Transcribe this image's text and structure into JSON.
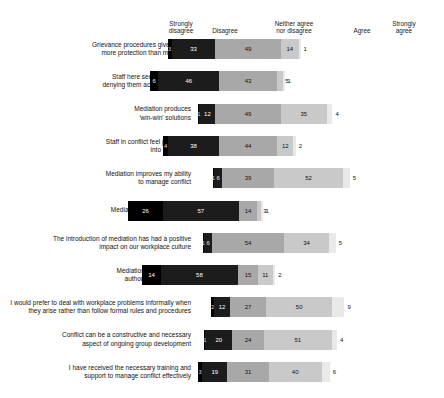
{
  "chart_data": {
    "type": "bar",
    "subtype": "diverging-stacked-likert",
    "title": "",
    "xlabel": "",
    "ylabel": "",
    "legend_position": "top",
    "grid": false,
    "value_unit": "percent",
    "categories_legend": [
      "Strongly\ndisagree",
      "Disagree",
      "Neither agree\nnor disagree",
      "Agree",
      "Strongly\nagree"
    ],
    "series_names": [
      "Strongly disagree",
      "Disagree",
      "Neither agree nor disagree",
      "Agree",
      "Strongly agree"
    ],
    "colors": [
      "#000000",
      "#1c1c1c",
      "#a8a8a8",
      "#c9c9c9",
      "#e9e9e9"
    ],
    "categories": [
      "Grievance procedures give parties more protection than mediation",
      "Staff here see mediation as denying them access to justice",
      "Mediation produces 'win-win' solutions",
      "Staff in conflict feel pressured into mediation",
      "Mediation improves my ability to manage conflict",
      "Mediation is a waste of time",
      "The introduction of mediation has had a positive impact on our workplace culture",
      "Mediation undermines my authority as a manager",
      "I would prefer to deal with workplace problems informally when they arise rather than follow formal rules and procedures",
      "Conflict can be a constructive and necessary aspect of ongoing group development",
      "I have received the necessary training and support to manage conflict effectively"
    ],
    "series": [
      {
        "name": "Strongly disagree",
        "values": [
          3,
          6,
          1,
          4,
          1,
          26,
          1,
          14,
          2,
          1,
          3
        ]
      },
      {
        "name": "Disagree",
        "values": [
          33,
          46,
          12,
          38,
          6,
          57,
          6,
          58,
          12,
          20,
          19
        ]
      },
      {
        "name": "Neither agree nor disagree",
        "values": [
          49,
          43,
          49,
          44,
          39,
          14,
          54,
          15,
          27,
          24,
          31
        ]
      },
      {
        "name": "Agree",
        "values": [
          14,
          5,
          35,
          12,
          52,
          3,
          34,
          11,
          50,
          51,
          40
        ]
      },
      {
        "name": "Strongly agree",
        "values": [
          1,
          1,
          4,
          2,
          5,
          1,
          5,
          2,
          9,
          4,
          6
        ]
      }
    ]
  },
  "rows": [
    {
      "label": "Grievance procedures give parties\nmore protection than mediation",
      "values": [
        3,
        33,
        49,
        14,
        1
      ]
    },
    {
      "label": "Staff here see mediation as\ndenying them access to justice",
      "values": [
        6,
        46,
        43,
        5,
        1
      ]
    },
    {
      "label": "Mediation produces\n'win-win' solutions",
      "values": [
        1,
        12,
        49,
        35,
        4
      ]
    },
    {
      "label": "Staff in conflict feel pressured\ninto mediation",
      "values": [
        4,
        38,
        44,
        12,
        2
      ]
    },
    {
      "label": "Mediation improves my ability\nto manage conflict",
      "values": [
        1,
        6,
        39,
        52,
        5
      ]
    },
    {
      "label": "Mediation is a waste of time",
      "values": [
        26,
        57,
        14,
        3,
        1
      ]
    },
    {
      "label": "The introduction of mediation has had a positive\nimpact on our workplace culture",
      "values": [
        1,
        6,
        54,
        34,
        5
      ]
    },
    {
      "label": "Mediation undermines my\nauthority as a manager",
      "values": [
        14,
        58,
        15,
        11,
        2
      ]
    },
    {
      "label": "I would prefer to deal with workplace problems informally when\nthey arise rather than follow formal rules and procedures",
      "values": [
        2,
        12,
        27,
        50,
        9
      ]
    },
    {
      "label": "Conflict can be a constructive and necessary\naspect of ongoing group development",
      "values": [
        1,
        20,
        24,
        51,
        4
      ]
    },
    {
      "label": "I have received the necessary training and\nsupport to manage conflict effectively",
      "values": [
        3,
        19,
        31,
        40,
        6
      ]
    }
  ],
  "legend": {
    "strongly_disagree": "Strongly\ndisagree",
    "disagree": "Disagree",
    "neither": "Neither agree\nnor disagree",
    "agree": "Agree",
    "strongly_agree": "Strongly\nagree"
  }
}
